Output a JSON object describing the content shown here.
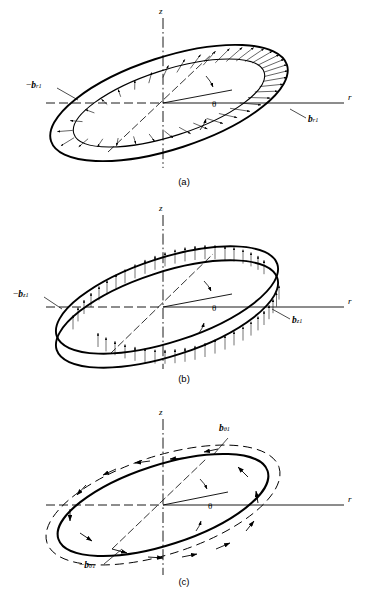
{
  "figure": {
    "coordinate_system": "cylindrical",
    "axes": {
      "vertical": "z",
      "horizontal": "r",
      "angle": "θ"
    },
    "panels": [
      {
        "id": "a",
        "caption": "(a)",
        "component": "radial",
        "label_positive": {
          "b": "b",
          "sub": "r1"
        },
        "label_negative": {
          "minus": "−",
          "b": "b",
          "sub": "r1"
        },
        "angle_label": "θ",
        "axis_z": "z",
        "axis_r": "r"
      },
      {
        "id": "b",
        "caption": "(b)",
        "component": "axial",
        "label_positive": {
          "b": "b",
          "sub": "z1"
        },
        "label_negative": {
          "minus": "−",
          "b": "b",
          "sub": "z1"
        },
        "angle_label": "θ",
        "axis_z": "z",
        "axis_r": "r"
      },
      {
        "id": "c",
        "caption": "(c)",
        "component": "tangential",
        "label_positive": {
          "b": "b",
          "sub": "θ1"
        },
        "label_negative": {
          "minus": "−",
          "b": "b",
          "sub": "θ1"
        },
        "angle_label": "θ",
        "axis_z": "z",
        "axis_r": "r"
      }
    ],
    "colors": {
      "ink": "#000000",
      "background": "#ffffff"
    }
  }
}
